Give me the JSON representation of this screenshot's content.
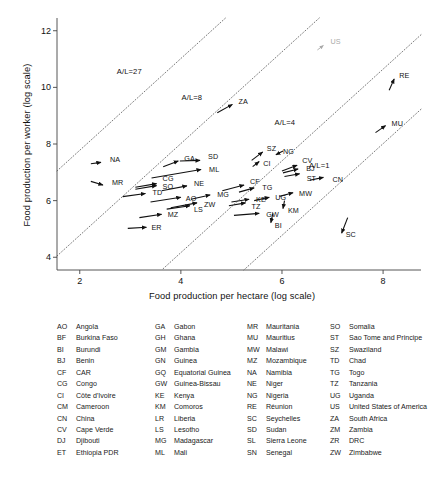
{
  "chart_data": {
    "type": "scatter",
    "title": "",
    "xlabel": "Food production per hectare (log scale)",
    "ylabel": "Food production per worker (log scale)",
    "xlim": [
      1.55,
      8.75
    ],
    "ylim": [
      3.55,
      12.45
    ],
    "xticks": [
      2,
      4,
      6,
      8
    ],
    "yticks": [
      4,
      6,
      8,
      10,
      12
    ],
    "grid": false,
    "legend_position": "none",
    "note": "Each point is an arrow (vector) from start to end position for a country; labels are ISO country codes.",
    "reference_lines": [
      {
        "label": "A/L=27",
        "label_x": 3.05,
        "label_y": 10.55
      },
      {
        "label": "A/L=8",
        "label_x": 4.33,
        "label_y": 9.62
      },
      {
        "label": "A/L=4",
        "label_x": 6.17,
        "label_y": 8.75
      },
      {
        "label": "A/L=1",
        "label_x": 6.85,
        "label_y": 7.22
      }
    ],
    "arrows": [
      {
        "code": "NA",
        "x0": 2.22,
        "y0": 7.3,
        "x1": 2.42,
        "y1": 7.35,
        "label_dx": 9,
        "label_dy": -2
      },
      {
        "code": "MR",
        "x0": 2.22,
        "y0": 6.68,
        "x1": 2.46,
        "y1": 6.55,
        "label_dx": 9,
        "label_dy": -2
      },
      {
        "code": "TD",
        "x0": 2.85,
        "y0": 6.14,
        "x1": 3.3,
        "y1": 6.25,
        "label_dx": 7,
        "label_dy": -1
      },
      {
        "code": "CG",
        "x0": 3.1,
        "y0": 6.47,
        "x1": 3.52,
        "y1": 6.6,
        "label_dx": 6,
        "label_dy": -5
      },
      {
        "code": "SO",
        "x0": 3.1,
        "y0": 6.4,
        "x1": 3.52,
        "y1": 6.53,
        "label_dx": 6,
        "label_dy": 1
      },
      {
        "code": "GA",
        "x0": 3.65,
        "y0": 7.2,
        "x1": 3.95,
        "y1": 7.4,
        "label_dx": 6,
        "label_dy": -2
      },
      {
        "code": "SD",
        "x0": 3.98,
        "y0": 7.4,
        "x1": 4.38,
        "y1": 7.42,
        "label_dx": 8,
        "label_dy": -3
      },
      {
        "code": "ML",
        "x0": 3.42,
        "y0": 6.8,
        "x1": 4.4,
        "y1": 7.1,
        "label_dx": 8,
        "label_dy": 1
      },
      {
        "code": "NE",
        "x0": 3.62,
        "y0": 6.35,
        "x1": 4.12,
        "y1": 6.52,
        "label_dx": 7,
        "label_dy": -2
      },
      {
        "code": "AO",
        "x0": 3.4,
        "y0": 5.95,
        "x1": 4.0,
        "y1": 6.12,
        "label_dx": 5,
        "label_dy": 2
      },
      {
        "code": "MG",
        "x0": 4.2,
        "y0": 6.05,
        "x1": 4.58,
        "y1": 6.2,
        "label_dx": 7,
        "label_dy": 0
      },
      {
        "code": "ZW",
        "x0": 3.8,
        "y0": 5.75,
        "x1": 4.32,
        "y1": 5.92,
        "label_dx": 7,
        "label_dy": 2
      },
      {
        "code": "LS",
        "x0": 3.72,
        "y0": 5.7,
        "x1": 4.18,
        "y1": 5.82,
        "label_dx": 4,
        "label_dy": 4
      },
      {
        "code": "MZ",
        "x0": 3.18,
        "y0": 5.4,
        "x1": 3.62,
        "y1": 5.52,
        "label_dx": 6,
        "label_dy": 1
      },
      {
        "code": "ER",
        "x0": 2.95,
        "y0": 5.02,
        "x1": 3.32,
        "y1": 5.06,
        "label_dx": 5,
        "label_dy": 1
      },
      {
        "code": "CF",
        "x0": 4.82,
        "y0": 6.35,
        "x1": 5.25,
        "y1": 6.55,
        "label_dx": 6,
        "label_dy": -3
      },
      {
        "code": "TG",
        "x0": 5.15,
        "y0": 6.3,
        "x1": 5.45,
        "y1": 6.45,
        "label_dx": 8,
        "label_dy": 0
      },
      {
        "code": "KE",
        "x0": 5.0,
        "y0": 5.95,
        "x1": 5.35,
        "y1": 6.05,
        "label_dx": 7,
        "label_dy": 1
      },
      {
        "code": "TZ",
        "x0": 4.95,
        "y0": 5.82,
        "x1": 5.28,
        "y1": 5.92,
        "label_dx": 6,
        "label_dy": 4
      },
      {
        "code": "UG",
        "x0": 5.45,
        "y0": 6.0,
        "x1": 5.75,
        "y1": 6.12,
        "label_dx": 6,
        "label_dy": 1
      },
      {
        "code": "GW",
        "x0": 5.05,
        "y0": 5.48,
        "x1": 5.55,
        "y1": 5.55,
        "label_dx": 7,
        "label_dy": 2
      },
      {
        "code": "SZ",
        "x0": 5.4,
        "y0": 7.42,
        "x1": 5.62,
        "y1": 7.72,
        "label_dx": 4,
        "label_dy": -3
      },
      {
        "code": "CI",
        "x0": 5.42,
        "y0": 7.2,
        "x1": 5.55,
        "y1": 7.38,
        "label_dx": 4,
        "label_dy": 2
      },
      {
        "code": "NG",
        "x0": 6.02,
        "y0": 7.75,
        "x1": 5.88,
        "y1": 7.62,
        "label_dx": 7,
        "label_dy": -3
      },
      {
        "code": "CV",
        "x0": 6.0,
        "y0": 7.05,
        "x1": 6.3,
        "y1": 7.25,
        "label_dx": 5,
        "label_dy": -4
      },
      {
        "code": "BJ",
        "x0": 6.02,
        "y0": 6.98,
        "x1": 6.32,
        "y1": 7.12,
        "label_dx": 8,
        "label_dy": 0
      },
      {
        "code": "ST",
        "x0": 6.05,
        "y0": 6.85,
        "x1": 6.35,
        "y1": 6.95,
        "label_dx": 7,
        "label_dy": 5
      },
      {
        "code": "CN",
        "x0": 6.55,
        "y0": 6.72,
        "x1": 6.82,
        "y1": 6.82,
        "label_dx": 9,
        "label_dy": 3
      },
      {
        "code": "MW",
        "x0": 5.95,
        "y0": 6.15,
        "x1": 6.22,
        "y1": 6.28,
        "label_dx": 6,
        "label_dy": 1
      },
      {
        "code": "KM",
        "x0": 6.05,
        "y0": 6.0,
        "x1": 6.02,
        "y1": 5.72,
        "label_dx": 5,
        "label_dy": 2
      },
      {
        "code": "BI",
        "x0": 5.82,
        "y0": 5.55,
        "x1": 5.78,
        "y1": 5.22,
        "label_dx": 4,
        "label_dy": 3
      },
      {
        "code": "ZA",
        "x0": 4.72,
        "y0": 9.1,
        "x1": 5.02,
        "y1": 9.4,
        "label_dx": 6,
        "label_dy": -2
      },
      {
        "code": "US",
        "x0": 6.7,
        "y0": 11.32,
        "x1": 6.82,
        "y1": 11.48,
        "label_dx": 7,
        "label_dy": -3,
        "gray": true
      },
      {
        "code": "RE",
        "x0": 8.12,
        "y0": 9.9,
        "x1": 8.22,
        "y1": 10.3,
        "label_dx": 5,
        "label_dy": -3
      },
      {
        "code": "MU",
        "x0": 7.85,
        "y0": 8.4,
        "x1": 8.05,
        "y1": 8.65,
        "label_dx": 6,
        "label_dy": -2
      },
      {
        "code": "SC",
        "x0": 7.3,
        "y0": 5.4,
        "x1": 7.18,
        "y1": 4.85,
        "label_dx": 4,
        "label_dy": 2
      }
    ]
  },
  "legend": {
    "columns": [
      [
        {
          "code": "AO",
          "name": "Angola"
        },
        {
          "code": "BF",
          "name": "Burkina Faso"
        },
        {
          "code": "BI",
          "name": "Burundi"
        },
        {
          "code": "BJ",
          "name": "Benin"
        },
        {
          "code": "CF",
          "name": "CAR"
        },
        {
          "code": "CG",
          "name": "Congo"
        },
        {
          "code": "CI",
          "name": "Côte d'Ivoire"
        },
        {
          "code": "CM",
          "name": "Cameroon"
        },
        {
          "code": "CN",
          "name": "China"
        },
        {
          "code": "CV",
          "name": "Cape Verde"
        },
        {
          "code": "DJ",
          "name": "Djibouti"
        },
        {
          "code": "ET",
          "name": "Ethiopia PDR"
        }
      ],
      [
        {
          "code": "GA",
          "name": "Gabon"
        },
        {
          "code": "GH",
          "name": "Ghana"
        },
        {
          "code": "GM",
          "name": "Gambia"
        },
        {
          "code": "GN",
          "name": "Guinea"
        },
        {
          "code": "GQ",
          "name": "Equatorial Guinea"
        },
        {
          "code": "GW",
          "name": "Guinea-Bissau"
        },
        {
          "code": "KE",
          "name": "Kenya"
        },
        {
          "code": "KM",
          "name": "Comoros"
        },
        {
          "code": "LR",
          "name": "Liberia"
        },
        {
          "code": "LS",
          "name": "Lesotho"
        },
        {
          "code": "MG",
          "name": "Madagascar"
        },
        {
          "code": "ML",
          "name": "Mali"
        }
      ],
      [
        {
          "code": "MR",
          "name": "Mauritania"
        },
        {
          "code": "MU",
          "name": "Mauritius"
        },
        {
          "code": "MW",
          "name": "Malawi"
        },
        {
          "code": "MZ",
          "name": "Mozambique"
        },
        {
          "code": "NA",
          "name": "Namibia"
        },
        {
          "code": "NE",
          "name": "Niger"
        },
        {
          "code": "NG",
          "name": "Nigeria"
        },
        {
          "code": "RE",
          "name": "Réunion"
        },
        {
          "code": "SC",
          "name": "Seychelles"
        },
        {
          "code": "SD",
          "name": "Sudan"
        },
        {
          "code": "SL",
          "name": "Sierra Leone"
        },
        {
          "code": "SN",
          "name": "Senegal"
        }
      ],
      [
        {
          "code": "SO",
          "name": "Somalia"
        },
        {
          "code": "ST",
          "name": "Sao Tome and Principe"
        },
        {
          "code": "SZ",
          "name": "Swaziland"
        },
        {
          "code": "TD",
          "name": "Chad"
        },
        {
          "code": "TG",
          "name": "Togo"
        },
        {
          "code": "TZ",
          "name": "Tanzania"
        },
        {
          "code": "UG",
          "name": "Uganda"
        },
        {
          "code": "US",
          "name": "United States of America"
        },
        {
          "code": "ZA",
          "name": "South Africa"
        },
        {
          "code": "ZM",
          "name": "Zambia"
        },
        {
          "code": "ZR",
          "name": "DRC"
        },
        {
          "code": "ZW",
          "name": "Zimbabwe"
        }
      ]
    ]
  },
  "caption": {
    "text": ""
  }
}
